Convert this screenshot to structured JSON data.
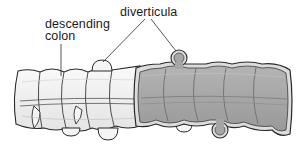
{
  "figure": {
    "labels": {
      "descending_colon_line1": "descending",
      "descending_colon_line2": "colon",
      "diverticula": "diverticula"
    },
    "colors": {
      "background": "#ffffff",
      "outline": "#2a2a2a",
      "exterior_fill": "#f2f2f2",
      "interior_fill": "#a9a9a9",
      "interior_shade": "#8f8f8f",
      "wall_highlight": "#d9d9d9"
    }
  }
}
